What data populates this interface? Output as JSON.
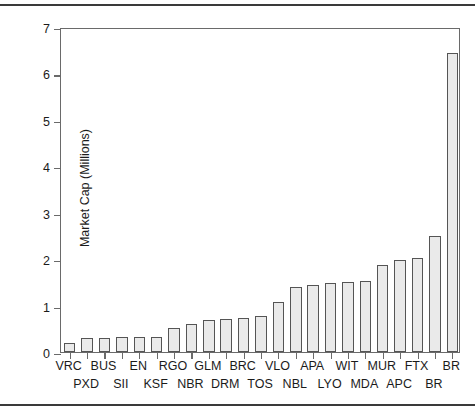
{
  "chart_data": {
    "type": "bar",
    "title": "",
    "xlabel": "",
    "ylabel": "Market Cap (Millions)",
    "ylim": [
      0,
      7
    ],
    "ytick_labels": [
      "0",
      "1",
      "2",
      "3",
      "4",
      "5",
      "6",
      "7"
    ],
    "ytick_values": [
      0,
      1,
      2,
      3,
      4,
      5,
      6,
      7
    ],
    "grid": false,
    "legend": null,
    "bar_fill_color": "#eaeaea",
    "bar_edge_color": "#555555",
    "frame_color": "#6a6a6a",
    "background_color": "#ffffff",
    "categories": [
      "VRC",
      "PXD",
      "BUS",
      "SII",
      "EN",
      "KSF",
      "RGO",
      "NBR",
      "GLM",
      "DRM",
      "BRC",
      "TOS",
      "VLO",
      "NBL",
      "APA",
      "LYO",
      "WIT",
      "MDA",
      "MUR",
      "APC",
      "FTX",
      "BR"
    ],
    "values": [
      0.19,
      0.3,
      0.3,
      0.32,
      0.33,
      0.33,
      0.51,
      0.6,
      0.68,
      0.72,
      0.73,
      0.77,
      1.08,
      1.39,
      1.45,
      1.49,
      1.51,
      1.54,
      1.87,
      1.98,
      2.02,
      2.5
    ],
    "values_note": "Sorted ascending; final tall bar is BR",
    "last_bar": {
      "label": "BR",
      "value": 6.45
    }
  },
  "axis": {
    "y_title": "Market Cap (Millions)"
  }
}
